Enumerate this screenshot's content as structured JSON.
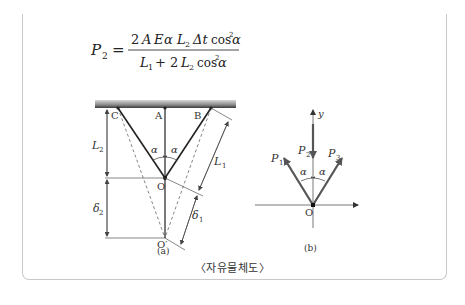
{
  "formula": {
    "lhs": "P",
    "lhs_sub": "2",
    "equals": "=",
    "numerator": {
      "coef": "2",
      "A": "A",
      "E": "E",
      "alpha": "α",
      "L": "L",
      "L_sub": "2",
      "delta": "Δt",
      "cos": "cos",
      "pow": "2",
      "alpha2": "α"
    },
    "denominator": {
      "L1": "L",
      "L1_sub": "1",
      "plus": "+ 2",
      "L2": "L",
      "L2_sub": "2",
      "cos": "cos",
      "pow": "2",
      "alpha": "α"
    }
  },
  "figure_a": {
    "points": {
      "C": "C",
      "A": "A",
      "B": "B",
      "O": "O",
      "O_prime": "O′"
    },
    "dims": {
      "L2": "L",
      "L2_sub": "2",
      "delta2": "δ",
      "delta2_sub": "2",
      "L1": "L",
      "L1_sub": "1",
      "delta1": "δ",
      "delta1_sub": "1"
    },
    "angle_left": "α",
    "angle_right": "α",
    "label": "(a)"
  },
  "figure_b": {
    "axis_y": "y",
    "forces": {
      "P1": "P",
      "P1_sub": "1",
      "P2": "P",
      "P2_sub": "2",
      "P3": "P",
      "P3_sub": "3"
    },
    "angle_left": "α",
    "angle_right": "α",
    "origin": "O",
    "label": "(b)"
  },
  "caption": "〈자유물체도〉"
}
